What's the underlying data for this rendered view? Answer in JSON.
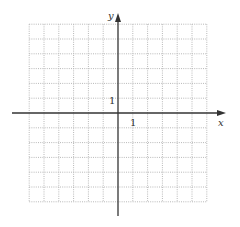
{
  "diagram": {
    "type": "coordinate-grid",
    "axes": {
      "x_label": "x",
      "y_label": "y",
      "x_tick_label": "1",
      "y_tick_label": "1"
    },
    "grid": {
      "x_min": -6,
      "x_max": 6,
      "y_min": -6,
      "y_max": 6,
      "step": 1,
      "line_style": "dotted",
      "grid_color": "#b8b8b8",
      "axis_color": "#333333"
    }
  }
}
